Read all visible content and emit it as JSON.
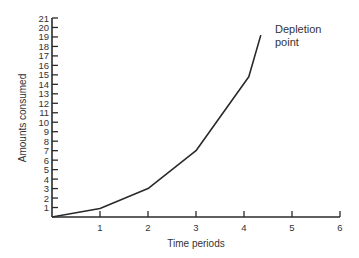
{
  "chart_data": {
    "type": "line",
    "title": "",
    "xlabel": "Time periods",
    "ylabel": "Amounts consumed",
    "x_ticks": [
      1,
      2,
      3,
      4,
      5,
      6
    ],
    "y_ticks": [
      1,
      2,
      3,
      4,
      5,
      6,
      7,
      8,
      9,
      10,
      11,
      12,
      13,
      14,
      15,
      16,
      17,
      18,
      19,
      20,
      21
    ],
    "xlim": [
      0,
      6
    ],
    "ylim": [
      0,
      21
    ],
    "grid": false,
    "legend": null,
    "series": [
      {
        "name": "Amounts consumed",
        "x": [
          0,
          1,
          2,
          3,
          4.1,
          4.35
        ],
        "y": [
          0,
          0.9,
          3,
          7,
          14.8,
          19.2
        ]
      }
    ],
    "annotations": [
      {
        "text": "Depletion point",
        "lines": [
          "Depletion",
          "point"
        ],
        "x": 4.35,
        "y": 19.2
      }
    ],
    "colors": {
      "line": "#2a2a2a",
      "axis": "#2a2a2a",
      "text": "#333333"
    }
  }
}
